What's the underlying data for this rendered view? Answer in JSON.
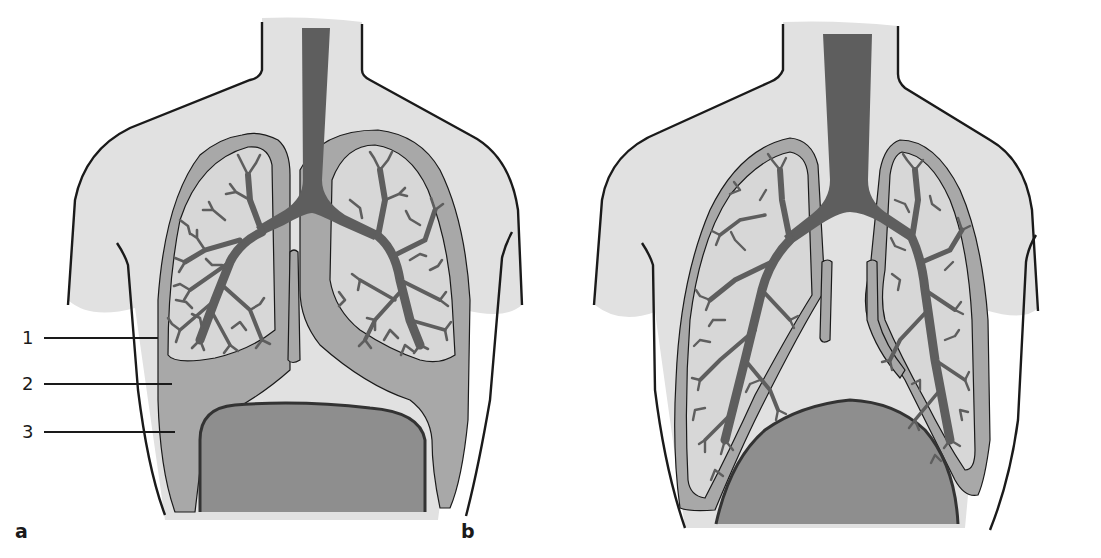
{
  "figure": {
    "panels": [
      {
        "id": "a",
        "label": "a",
        "description": "Lungs with pleural space; left side callouts mark pleural layers and fluid"
      },
      {
        "id": "b",
        "label": "b",
        "description": "Lungs in expanded state with diaphragm domed"
      }
    ],
    "callouts": [
      {
        "number": "1",
        "target": "parietal pleura"
      },
      {
        "number": "2",
        "target": "visceral pleura"
      },
      {
        "number": "3",
        "target": "pleural space (fluid)"
      }
    ],
    "colors": {
      "body": "#e1e1e1",
      "pleura": "#a8a8a8",
      "lung": "#d7d7d7",
      "airway": "#5e5e5e",
      "diaphragm": "#8e8e8e",
      "outline": "#1a1a1a"
    }
  }
}
